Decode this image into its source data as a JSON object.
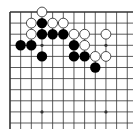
{
  "board": {
    "description": "Go problem diagram (top-left corner region)",
    "origin_x": 10,
    "origin_y": 12,
    "spacing_x": 10.66,
    "spacing_y": 11.1,
    "columns": 12,
    "rows": 11,
    "line_extend_right": 133,
    "line_extend_bottom": 129,
    "edges": {
      "top": true,
      "left": true,
      "right": false,
      "bottom": false
    },
    "colors": {
      "line": "#333333",
      "black_stone": "#000000",
      "white_stone": "#ffffff",
      "white_outline": "#222222",
      "background": "#ffffff"
    },
    "star_points": [
      [
        3,
        3
      ],
      [
        9,
        3
      ],
      [
        3,
        9
      ],
      [
        9,
        9
      ]
    ],
    "stones": {
      "white": [
        [
          3,
          0
        ],
        [
          2,
          1
        ],
        [
          4,
          1
        ],
        [
          5,
          1
        ],
        [
          2,
          2
        ],
        [
          6,
          2
        ],
        [
          7,
          2
        ],
        [
          9,
          2
        ],
        [
          7,
          3
        ],
        [
          8,
          4
        ],
        [
          9,
          4
        ]
      ],
      "black": [
        [
          3,
          1
        ],
        [
          3,
          2
        ],
        [
          4,
          2
        ],
        [
          5,
          2
        ],
        [
          1,
          3
        ],
        [
          2,
          3
        ],
        [
          6,
          3
        ],
        [
          3,
          4
        ],
        [
          6,
          4
        ],
        [
          7,
          4
        ],
        [
          8,
          5
        ]
      ]
    }
  }
}
